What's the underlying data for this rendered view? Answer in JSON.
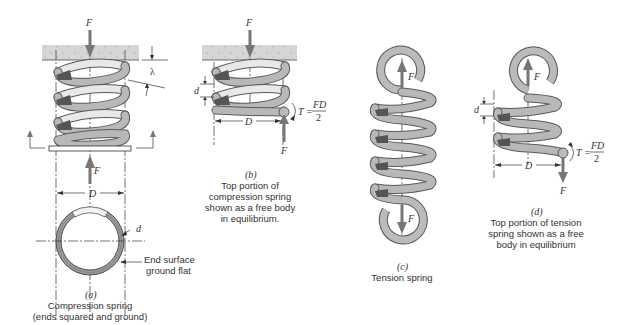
{
  "figure": {
    "panels": [
      {
        "id": "a",
        "label": "(a)",
        "caption_lines": [
          "Compression spring",
          "(ends squared and ground)"
        ],
        "symbols": {
          "force_top": "F",
          "force_bottom": "F",
          "deflection": "λ",
          "diameter": "D",
          "wire_diameter": "d"
        },
        "annotation": [
          "End surface",
          "ground flat"
        ]
      },
      {
        "id": "b",
        "label": "(b)",
        "caption_lines": [
          "Top portion of",
          "compression spring",
          "shown as a free body",
          "in equilibrium."
        ],
        "symbols": {
          "force_top": "F",
          "force_bottom": "F",
          "diameter": "D",
          "wire_diameter": "d",
          "torque": "T =",
          "torque_num": "FD",
          "torque_den": "2"
        }
      },
      {
        "id": "c",
        "label": "(c)",
        "caption_lines": [
          "Tension spring"
        ],
        "symbols": {
          "force_top": "F",
          "force_bottom": "F"
        }
      },
      {
        "id": "d",
        "label": "(d)",
        "caption_lines": [
          "Top portion of tension",
          "spring shown as a free",
          "body in equilibrium"
        ],
        "symbols": {
          "force_top": "F",
          "force_bottom": "F",
          "diameter": "D",
          "wire_diameter": "d",
          "torque": "T =",
          "torque_num": "FD",
          "torque_den": "2"
        }
      }
    ]
  }
}
